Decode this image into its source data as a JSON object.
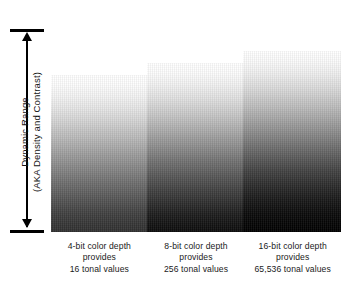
{
  "figure": {
    "axis": {
      "label_line1": "Dynamic Range",
      "label_line2": "(AKA Density and Contrast)",
      "arrow_top_icon": "arrow-up-icon",
      "arrow_bottom_icon": "arrow-down-icon",
      "cap_top_name": "axis-cap-top",
      "cap_bottom_name": "axis-cap-bottom"
    },
    "ramps": [
      {
        "id": "ramp-4bit",
        "bit_depth": "4-bit",
        "top_color": "#ffffff",
        "bottom_color": "#303030"
      },
      {
        "id": "ramp-8bit",
        "bit_depth": "8-bit",
        "top_color": "#ffffff",
        "bottom_color": "#0c0c0c"
      },
      {
        "id": "ramp-16bit",
        "bit_depth": "16-bit",
        "top_color": "#ffffff",
        "bottom_color": "#000000"
      }
    ],
    "captions": [
      {
        "line1": "4-bit color depth",
        "line2": "provides",
        "line3": "16 tonal values"
      },
      {
        "line1": "8-bit color depth",
        "line2": "provides",
        "line3": "256 tonal values"
      },
      {
        "line1": "16-bit color depth",
        "line2": "provides",
        "line3": "65,536 tonal values"
      }
    ]
  },
  "chart_data": {
    "type": "bar",
    "xlabel": "",
    "ylabel": "Dynamic Range (AKA Density and Contrast)",
    "categories": [
      "4-bit color depth",
      "8-bit color depth",
      "16-bit color depth"
    ],
    "values": [
      16,
      256,
      65536
    ],
    "value_labels": [
      "16 tonal values",
      "256 tonal values",
      "65,536 tonal values"
    ],
    "grid": false,
    "legend": "none"
  }
}
